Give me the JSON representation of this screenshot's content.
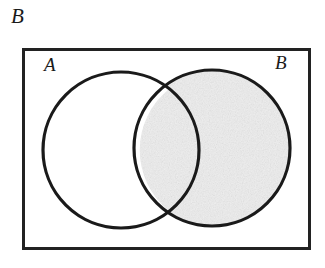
{
  "figure": {
    "caption_label": "B"
  },
  "universe": {
    "name": "universal-set-rectangle",
    "border_color": "#222222"
  },
  "sets": [
    {
      "id": "A",
      "label": "A",
      "label_position": "top-left",
      "shaded": false,
      "fill_color": "#ffffff",
      "stroke_color": "#1a1a1a"
    },
    {
      "id": "B",
      "label": "B",
      "label_position": "top-right",
      "shaded": true,
      "fill_color": "#dcdcdc",
      "stroke_color": "#1a1a1a"
    }
  ],
  "regions": {
    "a_only": {
      "name": "A-only",
      "shaded": false
    },
    "intersection": {
      "name": "A-intersect-B",
      "shaded": true
    },
    "b_only": {
      "name": "B-only",
      "shaded": true
    },
    "outside": {
      "name": "complement-of-A-union-B",
      "shaded": false
    }
  },
  "colors": {
    "shade": "#dcdcdc",
    "stroke": "#1a1a1a",
    "box_border": "#222222",
    "background": "#ffffff"
  },
  "geometry": {
    "box": {
      "x": 22,
      "y": 48,
      "width": 289,
      "height": 202
    },
    "circle_a": {
      "cx": 121,
      "cy": 150,
      "r": 78
    },
    "circle_b": {
      "cx": 212,
      "cy": 148,
      "r": 78
    }
  }
}
